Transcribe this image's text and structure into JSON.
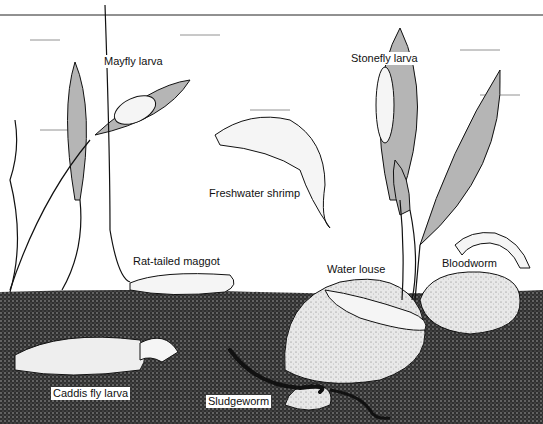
{
  "diagram": {
    "type": "illustration",
    "labels": [
      {
        "id": "mayfly",
        "text": "Mayfly larva",
        "x": 102,
        "y": 55
      },
      {
        "id": "stonefly",
        "text": "Stonefly larva",
        "x": 349,
        "y": 52
      },
      {
        "id": "shrimp",
        "text": "Freshwater shrimp",
        "x": 207,
        "y": 187
      },
      {
        "id": "maggot",
        "text": "Rat-tailed maggot",
        "x": 131,
        "y": 255
      },
      {
        "id": "louse",
        "text": "Water louse",
        "x": 325,
        "y": 263
      },
      {
        "id": "bloodworm",
        "text": "Bloodworm",
        "x": 440,
        "y": 257
      },
      {
        "id": "caddis",
        "text": "Caddis fly larva",
        "x": 51,
        "y": 387
      },
      {
        "id": "sludgeworm",
        "text": "Sludgeworm",
        "x": 206,
        "y": 395
      }
    ],
    "colors": {
      "ink": "#111111",
      "sediment": "#3a3a3a",
      "rock": "#cfcfcf",
      "leaf": "#a9a9a9",
      "background": "#ffffff"
    }
  }
}
